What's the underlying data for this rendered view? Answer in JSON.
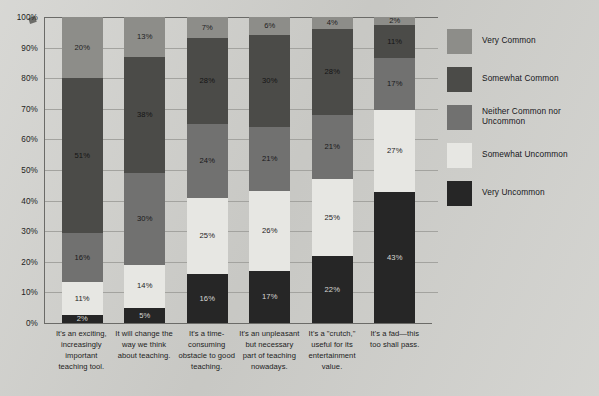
{
  "chart_data": {
    "type": "bar",
    "subtype": "stacked-bar-100-percent",
    "title": "",
    "xlabel": "",
    "ylabel": "",
    "ylim": [
      0,
      100
    ],
    "ytick_labels": [
      "100%",
      "90%",
      "80%",
      "70%",
      "60%",
      "50%",
      "40%",
      "30%",
      "20%",
      "10%",
      "0%"
    ],
    "yticks": [
      100,
      90,
      80,
      70,
      60,
      50,
      40,
      30,
      20,
      10,
      0
    ],
    "grid": true,
    "legend_position": "right",
    "value_suffix": "%",
    "categories": [
      "It's an exciting, increasingly important teaching tool.",
      "It will change the way we think about teaching.",
      "It's a time-consuming obstacle to good teaching.",
      "It's an unpleasant but necessary part of teaching nowadays.",
      "It's a \"crutch,\" useful for its entertainment value.",
      "It's a fad—this too shall pass."
    ],
    "series": [
      {
        "name": "Very Common",
        "color": "#8d8d89",
        "label_color": "#1d1d1d",
        "values": [
          20,
          13,
          7,
          6,
          4,
          2
        ]
      },
      {
        "name": "Somewhat Common",
        "color": "#4b4b48",
        "label_color": "#141414",
        "values": [
          51,
          38,
          28,
          30,
          28,
          11
        ]
      },
      {
        "name": "Neither Common nor Uncommon",
        "color": "#717170",
        "label_color": "#18181a",
        "values": [
          16,
          30,
          24,
          21,
          21,
          17
        ]
      },
      {
        "name": "Somewhat Uncommon",
        "color": "#e7e7e3",
        "label_color": "#1d1d1d",
        "values": [
          11,
          14,
          25,
          26,
          25,
          27
        ]
      },
      {
        "name": "Very Uncommon",
        "color": "#262626",
        "label_color": "#d8d8d4",
        "values": [
          2,
          5,
          16,
          17,
          22,
          43
        ]
      }
    ]
  },
  "legend": {
    "items": [
      {
        "label": "Very Common",
        "color": "#8d8d89"
      },
      {
        "label": "Somewhat Common",
        "color": "#4b4b48"
      },
      {
        "label": "Neither Common nor Uncommon",
        "color": "#717170"
      },
      {
        "label": "Somewhat Uncommon",
        "color": "#e7e7e3"
      },
      {
        "label": "Very Uncommon",
        "color": "#262626"
      }
    ]
  }
}
